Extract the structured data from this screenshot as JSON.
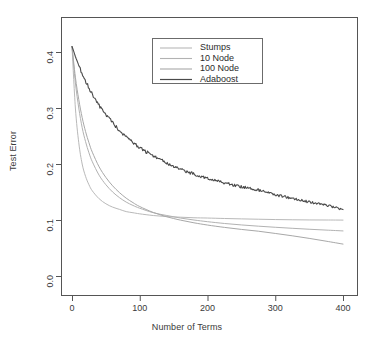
{
  "chart_data": {
    "type": "line",
    "title": "",
    "xlabel": "Number of Terms",
    "ylabel": "Test Error",
    "xlim": [
      0,
      400
    ],
    "ylim": [
      0.0,
      0.45
    ],
    "grid": false,
    "legend_position": "top-center",
    "xticks": [
      0,
      100,
      200,
      300,
      400
    ],
    "xtick_labels": [
      "0",
      "100",
      "200",
      "300",
      "400"
    ],
    "yticks": [
      0.0,
      0.1,
      0.2,
      0.3,
      0.4
    ],
    "ytick_labels": [
      "0.0",
      "0.1",
      "0.2",
      "0.3",
      "0.4"
    ],
    "x": [
      0,
      5,
      10,
      15,
      20,
      25,
      30,
      40,
      50,
      60,
      70,
      80,
      90,
      100,
      120,
      140,
      160,
      180,
      200,
      225,
      250,
      275,
      300,
      325,
      350,
      375,
      400
    ],
    "series": [
      {
        "name": "Stumps",
        "color": "#b9b9b9",
        "width": 1.0,
        "noise": 0.0,
        "values": [
          0.41,
          0.3,
          0.238,
          0.2,
          0.178,
          0.163,
          0.152,
          0.138,
          0.129,
          0.123,
          0.119,
          0.115,
          0.113,
          0.111,
          0.108,
          0.106,
          0.105,
          0.104,
          0.1035,
          0.1027,
          0.102,
          0.1014,
          0.1008,
          0.1004,
          0.1001,
          0.1,
          0.0998
        ]
      },
      {
        "name": "10 Node",
        "color": "#b2b2b2",
        "width": 1.0,
        "noise": 0.0,
        "values": [
          0.41,
          0.345,
          0.3,
          0.265,
          0.24,
          0.22,
          0.204,
          0.18,
          0.163,
          0.15,
          0.14,
          0.132,
          0.126,
          0.121,
          0.113,
          0.108,
          0.1035,
          0.1,
          0.097,
          0.0938,
          0.0912,
          0.089,
          0.087,
          0.0852,
          0.0835,
          0.082,
          0.0805
        ]
      },
      {
        "name": "100 Node",
        "color": "#a8a8a8",
        "width": 1.0,
        "noise": 0.0,
        "values": [
          0.41,
          0.355,
          0.315,
          0.283,
          0.258,
          0.238,
          0.221,
          0.195,
          0.176,
          0.161,
          0.149,
          0.139,
          0.131,
          0.124,
          0.1135,
          0.1058,
          0.0998,
          0.095,
          0.091,
          0.0868,
          0.0832,
          0.08,
          0.076,
          0.0718,
          0.0672,
          0.0622,
          0.057
        ]
      },
      {
        "name": "Adaboost",
        "color": "#4a4a4a",
        "width": 1.1,
        "noise": 0.0035,
        "values": [
          0.41,
          0.392,
          0.376,
          0.362,
          0.348,
          0.336,
          0.325,
          0.305,
          0.288,
          0.273,
          0.26,
          0.248,
          0.238,
          0.229,
          0.214,
          0.2015,
          0.191,
          0.182,
          0.175,
          0.1665,
          0.1595,
          0.1535,
          0.1452,
          0.1385,
          0.1322,
          0.1265,
          0.119
        ]
      }
    ]
  },
  "legend": {
    "entries": [
      {
        "label": "Stumps"
      },
      {
        "label": "10 Node"
      },
      {
        "label": "100 Node"
      },
      {
        "label": "Adaboost"
      }
    ]
  }
}
